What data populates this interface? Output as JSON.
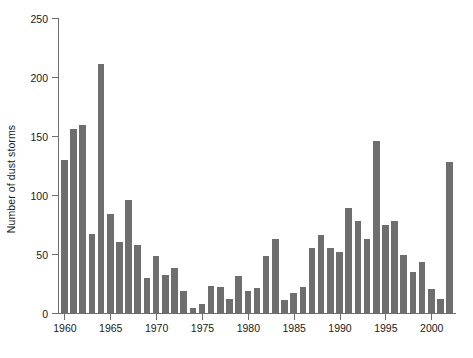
{
  "chart_data": {
    "type": "bar",
    "title": "",
    "xlabel": "",
    "ylabel": "Number of dust storms",
    "ylim": [
      0,
      250
    ],
    "xlim": [
      1959.3,
      2002.7
    ],
    "grid": false,
    "legend": null,
    "bar_color": "#6e6e6e",
    "background_color": "#ffffff",
    "axis_color": "#6e6e6e",
    "text_color": "#1a1a1a",
    "ytick_labels": [
      "0",
      "50",
      "100",
      "150",
      "200",
      "250"
    ],
    "ytick_values": [
      0,
      50,
      100,
      150,
      200,
      250
    ],
    "xtick_labels": [
      "1960",
      "1965",
      "1970",
      "1975",
      "1980",
      "1985",
      "1990",
      "1995",
      "2000"
    ],
    "xtick_values": [
      1960,
      1965,
      1970,
      1975,
      1980,
      1985,
      1990,
      1995,
      2000
    ],
    "categories": [
      1960,
      1961,
      1962,
      1963,
      1964,
      1965,
      1966,
      1967,
      1968,
      1969,
      1970,
      1971,
      1972,
      1973,
      1974,
      1975,
      1976,
      1977,
      1978,
      1979,
      1980,
      1981,
      1982,
      1983,
      1984,
      1985,
      1986,
      1987,
      1988,
      1989,
      1990,
      1991,
      1992,
      1993,
      1994,
      1995,
      1996,
      1997,
      1998,
      1999,
      2000,
      2001,
      2002
    ],
    "values": [
      130,
      156,
      159,
      67,
      211,
      84,
      60,
      96,
      58,
      30,
      48,
      32,
      38,
      19,
      4,
      8,
      23,
      22,
      12,
      31,
      19,
      21,
      48,
      63,
      11,
      17,
      22,
      55,
      66,
      55,
      52,
      89,
      78,
      63,
      146,
      75,
      78,
      49,
      35,
      43,
      20,
      12,
      128
    ]
  }
}
